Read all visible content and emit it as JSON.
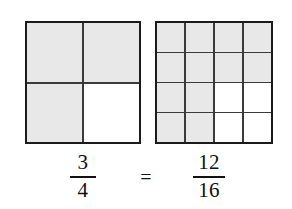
{
  "figure": {
    "background_color": "#ffffff",
    "line_color": "#1b1b1b",
    "shaded_color": "#e8e8e8",
    "unshaded_color": "#ffffff"
  },
  "models": [
    {
      "name": "three-fourths-model",
      "rows": 2,
      "columns": 4,
      "total_cells": 4,
      "shaded_cells": 3,
      "cells": [
        {
          "index": 1,
          "shaded": true
        },
        {
          "index": 2,
          "shaded": true
        },
        {
          "index": 3,
          "shaded": true
        },
        {
          "index": 4,
          "shaded": false
        }
      ]
    },
    {
      "name": "twelve-sixteenths-model",
      "rows": 4,
      "columns": 4,
      "total_cells": 16,
      "shaded_cells": 12,
      "cells": [
        {
          "index": 1,
          "shaded": true
        },
        {
          "index": 2,
          "shaded": true
        },
        {
          "index": 3,
          "shaded": true
        },
        {
          "index": 4,
          "shaded": true
        },
        {
          "index": 5,
          "shaded": true
        },
        {
          "index": 6,
          "shaded": true
        },
        {
          "index": 7,
          "shaded": true
        },
        {
          "index": 8,
          "shaded": true
        },
        {
          "index": 9,
          "shaded": true
        },
        {
          "index": 10,
          "shaded": true
        },
        {
          "index": 11,
          "shaded": false
        },
        {
          "index": 12,
          "shaded": false
        },
        {
          "index": 13,
          "shaded": true
        },
        {
          "index": 14,
          "shaded": true
        },
        {
          "index": 15,
          "shaded": false
        },
        {
          "index": 16,
          "shaded": false
        }
      ]
    }
  ],
  "equation": {
    "left_fraction": {
      "numerator": "3",
      "denominator": "4"
    },
    "operator": "=",
    "right_fraction": {
      "numerator": "12",
      "denominator": "16"
    }
  }
}
